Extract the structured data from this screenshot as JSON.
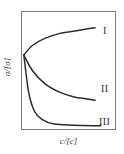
{
  "chart_data": {
    "type": "line",
    "title": "",
    "xlabel": "c/[c]",
    "ylabel": "σ/[σ]",
    "xlim": [
      0,
      1
    ],
    "ylim": [
      0,
      1
    ],
    "grid": false,
    "legend_position": "inline-right",
    "axis_ticks": {
      "x": [],
      "y": []
    },
    "annotations": [
      "I",
      "II",
      "III"
    ],
    "series": [
      {
        "name": "I",
        "label": "I",
        "color": "#2b2b2b",
        "description": "rising concave curve from common origin",
        "x": [
          0.03,
          0.12,
          0.25,
          0.4,
          0.55,
          0.7,
          0.78
        ],
        "y": [
          0.63,
          0.71,
          0.77,
          0.81,
          0.83,
          0.85,
          0.86
        ]
      },
      {
        "name": "II",
        "label": "II",
        "color": "#2b2b2b",
        "description": "decaying convex curve from common origin",
        "x": [
          0.03,
          0.12,
          0.25,
          0.4,
          0.55,
          0.7,
          0.78
        ],
        "y": [
          0.63,
          0.5,
          0.39,
          0.32,
          0.28,
          0.26,
          0.25
        ]
      },
      {
        "name": "III",
        "label": "III",
        "color": "#2b2b2b",
        "description": "sharply decaying curve to flat asymptote",
        "x": [
          0.03,
          0.08,
          0.14,
          0.22,
          0.35,
          0.55,
          0.75,
          0.84
        ],
        "y": [
          0.63,
          0.32,
          0.16,
          0.09,
          0.05,
          0.04,
          0.035,
          0.035
        ]
      }
    ],
    "origin_point": {
      "x": 0.03,
      "y": 0.63
    }
  },
  "figure": {
    "xlabel": "c/[c]",
    "ylabel": "σ/[σ]",
    "series_labels": {
      "one": "I",
      "two": "II",
      "three": "III"
    }
  },
  "colors": {
    "curve": "#2b2b2b",
    "frame": "#7d7d7d",
    "background": "#fefefe",
    "text": "#3a3a3a"
  }
}
